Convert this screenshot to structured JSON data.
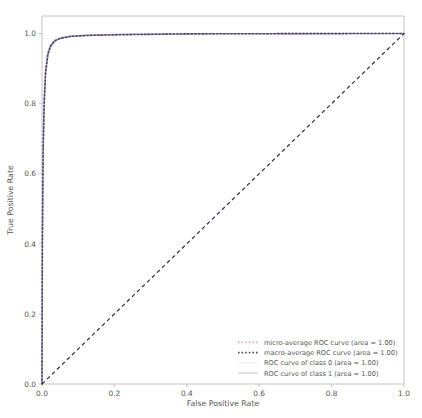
{
  "chart_data": {
    "type": "line",
    "title": "",
    "xlabel": "False Positive Rate",
    "ylabel": "True Positive Rate",
    "xlim": [
      0.0,
      1.0
    ],
    "ylim": [
      0.0,
      1.05
    ],
    "grid": false,
    "legend_position": "lower right",
    "xticks": [
      "0.0",
      "0.2",
      "0.4",
      "0.6",
      "0.8",
      "1.0"
    ],
    "xtick_values": [
      0.0,
      0.2,
      0.4,
      0.6,
      0.8,
      1.0
    ],
    "yticks": [
      "0.0",
      "0.2",
      "0.4",
      "0.6",
      "0.8",
      "1.0"
    ],
    "ytick_values": [
      0.0,
      0.2,
      0.4,
      0.6,
      0.8,
      1.0
    ],
    "series": [
      {
        "name": "micro-average ROC curve (area = 1.00)",
        "legend_label": "micro-average ROC curve (area = 1.00)",
        "area": "1.00",
        "style": "dotted",
        "color": "#d4aad4",
        "linewidth": 1.6,
        "x": [
          0.0,
          0.001,
          0.003,
          0.006,
          0.01,
          0.016,
          0.024,
          0.034,
          0.05,
          0.08,
          0.14,
          0.25,
          0.4,
          0.6,
          0.8,
          1.0
        ],
        "y": [
          0.0,
          0.42,
          0.68,
          0.82,
          0.9,
          0.945,
          0.968,
          0.98,
          0.988,
          0.993,
          0.996,
          0.998,
          0.999,
          0.9995,
          0.9998,
          1.0
        ]
      },
      {
        "name": "macro-average ROC curve (area = 1.00)",
        "legend_label": "macro-average ROC curve (area = 1.00)",
        "area": "1.00",
        "style": "dotted",
        "color": "#4a4a6a",
        "linewidth": 1.6,
        "x": [
          0.0,
          0.001,
          0.003,
          0.006,
          0.01,
          0.016,
          0.024,
          0.034,
          0.05,
          0.08,
          0.14,
          0.25,
          0.4,
          0.6,
          0.8,
          1.0
        ],
        "y": [
          0.0,
          0.4,
          0.66,
          0.8,
          0.89,
          0.94,
          0.965,
          0.978,
          0.986,
          0.992,
          0.995,
          0.997,
          0.999,
          0.9995,
          0.9998,
          1.0
        ]
      },
      {
        "name": "ROC curve of class 0 (area = 1.00)",
        "legend_label": "ROC curve of class 0 (area = 1.00)",
        "area": "1.00",
        "style": "solid",
        "color": "#f2f2f2",
        "linewidth": 1.1,
        "x": [
          0.0,
          0.002,
          0.005,
          0.01,
          0.02,
          0.04,
          0.08,
          0.2,
          0.5,
          1.0
        ],
        "y": [
          0.0,
          0.55,
          0.78,
          0.9,
          0.96,
          0.985,
          0.994,
          0.998,
          0.9995,
          1.0
        ]
      },
      {
        "name": "ROC curve of class 1 (area = 1.00)",
        "legend_label": "ROC curve of class 1 (area = 1.00)",
        "area": "1.00",
        "style": "solid",
        "color": "#c8c8c8",
        "linewidth": 1.1,
        "x": [
          0.0,
          0.002,
          0.005,
          0.01,
          0.02,
          0.04,
          0.08,
          0.2,
          0.5,
          1.0
        ],
        "y": [
          0.0,
          0.52,
          0.76,
          0.885,
          0.955,
          0.982,
          0.993,
          0.9975,
          0.9993,
          1.0
        ]
      }
    ],
    "reference_line": {
      "name": "chance-diagonal",
      "style": "dashed",
      "color": "#2b2b4a",
      "linewidth": 1.2,
      "x": [
        0.0,
        1.0
      ],
      "y": [
        0.0,
        1.0
      ]
    }
  },
  "colors": {
    "background": "#ffffff",
    "spine": "#bdbdbd",
    "text": "#555555",
    "diagonal": "#2b2b4a"
  }
}
